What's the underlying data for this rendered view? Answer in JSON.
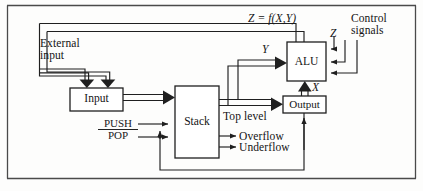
{
  "figure": {
    "frame": {
      "top_rule": true,
      "bottom_rule": true,
      "left_rule": true,
      "right_rule": true
    },
    "colors": {
      "line": "#1f1f1f",
      "text": "#141414",
      "background": "#fdfdfc"
    }
  },
  "blocks": [
    {
      "id": "input",
      "label": "Input",
      "x": 70,
      "y": 88,
      "w": 53,
      "h": 23
    },
    {
      "id": "stack",
      "label": "Stack",
      "x": 175,
      "y": 86,
      "w": 44,
      "h": 72
    },
    {
      "id": "alu",
      "label": "ALU",
      "x": 287,
      "y": 42,
      "w": 39,
      "h": 39
    },
    {
      "id": "output",
      "label": "Output",
      "x": 283,
      "y": 96,
      "w": 43,
      "h": 17
    }
  ],
  "labels": {
    "external_input_line1": "External",
    "external_input_line2": "input",
    "z_equals": "Z = f(X,Y)",
    "control_line1": "Control",
    "control_line2": "signals",
    "z": "Z",
    "y": "Y",
    "x": "X",
    "push": "PUSH",
    "pop": "POP",
    "top_level": "Top level",
    "overflow": "Overflow",
    "underflow": "Underflow"
  },
  "signals": [
    {
      "name": "external-input",
      "from": "left-edge",
      "to": "input",
      "style": "thick-arrow"
    },
    {
      "name": "alu-feedback-a",
      "from": "alu-top",
      "to": "input",
      "style": "thin-arrow"
    },
    {
      "name": "alu-feedback-b",
      "from": "alu-top",
      "to": "input",
      "style": "thin-arrow"
    },
    {
      "name": "input-to-stack",
      "from": "input",
      "to": "stack",
      "style": "thick-arrow"
    },
    {
      "name": "push-pop",
      "from": "push-pop",
      "to": "stack",
      "style": "thin-arrow"
    },
    {
      "name": "top-level-bus",
      "from": "stack",
      "to": "output",
      "style": "thick-arrow"
    },
    {
      "name": "top-level-to-y",
      "from": "stack",
      "to": "alu",
      "style": "thick-arrow"
    },
    {
      "name": "output-to-x",
      "from": "output",
      "to": "alu",
      "style": "thick-arrow"
    },
    {
      "name": "overflow-flag",
      "from": "stack",
      "to": "label",
      "style": "thin-arrow"
    },
    {
      "name": "underflow-flag",
      "from": "stack",
      "to": "label",
      "style": "thin-arrow"
    },
    {
      "name": "control-signal-1",
      "from": "control",
      "to": "alu",
      "style": "thin-arrow"
    },
    {
      "name": "control-signal-2",
      "from": "control",
      "to": "alu",
      "style": "thin-arrow"
    },
    {
      "name": "control-signal-3",
      "from": "control",
      "to": "alu",
      "style": "thin-arrow"
    },
    {
      "name": "output-feedback",
      "from": "output",
      "to": "push-pop-junction",
      "style": "thin-arrow"
    }
  ]
}
